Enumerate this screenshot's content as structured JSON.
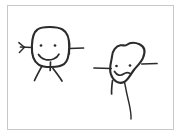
{
  "image": {
    "title": "Two hand-drawn stick figures",
    "kind": "pencil-sketch",
    "width": 182,
    "height": 138,
    "background_color": "#ffffff",
    "ink_color": "#2b2b2b",
    "border_color": "#c8c8c8",
    "visible_text": "",
    "figure_count": 2
  },
  "frame": {
    "label": "sketch-frame",
    "x": 7,
    "y": 5,
    "width": 167,
    "height": 125,
    "stroke": "#c8c8c8",
    "stroke_width": 1
  },
  "figures": [
    {
      "id": "left-figure",
      "label": "Left stick figure",
      "expression": "smiling",
      "head_shape": "rounded square",
      "head_center": [
        50,
        47
      ],
      "eyes": [
        {
          "label": "left-eye",
          "cx": 40,
          "cy": 45,
          "r": 1.2
        },
        {
          "label": "right-eye",
          "cx": 55,
          "cy": 45,
          "r": 1.2
        }
      ],
      "mouth": "upward curved smile",
      "arms": [
        {
          "label": "left-arm",
          "direction": "left",
          "has_fingers": true
        },
        {
          "label": "right-arm",
          "direction": "right",
          "has_fingers": false
        }
      ],
      "legs": [
        {
          "label": "left-leg",
          "direction": "down-left"
        },
        {
          "label": "right-leg",
          "direction": "down-right"
        }
      ],
      "neck": "short vertical stub"
    },
    {
      "id": "right-figure",
      "label": "Right stick figure",
      "expression": "worried",
      "head_shape": "irregular blob with top notch",
      "head_center": [
        124,
        68
      ],
      "eyes": [
        {
          "label": "left-eye",
          "cx": 116,
          "cy": 66,
          "r": 1.2
        },
        {
          "label": "right-eye",
          "cx": 130,
          "cy": 66,
          "r": 1.2
        }
      ],
      "mouth": "wavy squiggle frown",
      "arms": [
        {
          "label": "left-arm",
          "direction": "left",
          "has_fingers": false
        },
        {
          "label": "right-arm",
          "direction": "right",
          "has_fingers": false
        }
      ],
      "legs": [
        {
          "label": "left-leg",
          "direction": "short down stub"
        },
        {
          "label": "right-leg",
          "direction": "long curving down"
        }
      ],
      "neck": "none"
    }
  ]
}
